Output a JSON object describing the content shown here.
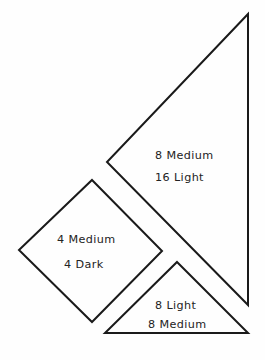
{
  "canvas": {
    "width": 265,
    "height": 360,
    "background_color": "#fefefe",
    "line_color": "#1a1a1a",
    "text_color": "#232323"
  },
  "shapes": [
    {
      "name": "large-right-triangle",
      "type": "triangle",
      "points": "248,14 107,162 248,305",
      "labels": [
        {
          "text": "8  Medium",
          "x": 155,
          "y": 159,
          "anchor": "start"
        },
        {
          "text": "16  Light",
          "x": 155,
          "y": 181,
          "anchor": "start"
        }
      ]
    },
    {
      "name": "square-on-point-diamond",
      "type": "diamond",
      "points": "92,180 162,251 92,322 19,250",
      "labels": [
        {
          "text": "4  Medium",
          "x": 57,
          "y": 243,
          "anchor": "start"
        },
        {
          "text": "4  Dark",
          "x": 64,
          "y": 268,
          "anchor": "start"
        }
      ]
    },
    {
      "name": "small-right-triangle",
      "type": "triangle",
      "points": "177,262 248,333 105,333",
      "labels": [
        {
          "text": "8  Light",
          "x": 155,
          "y": 309,
          "anchor": "start"
        },
        {
          "text": "8  Medium",
          "x": 148,
          "y": 328,
          "anchor": "start"
        }
      ]
    }
  ],
  "legend": {
    "fabric_values": [
      "Light",
      "Medium",
      "Dark"
    ],
    "quantities": [
      {
        "piece": "large-right-triangle",
        "count": 8,
        "fabric": "Medium"
      },
      {
        "piece": "large-right-triangle",
        "count": 16,
        "fabric": "Light"
      },
      {
        "piece": "square-on-point-diamond",
        "count": 4,
        "fabric": "Medium"
      },
      {
        "piece": "square-on-point-diamond",
        "count": 4,
        "fabric": "Dark"
      },
      {
        "piece": "small-right-triangle",
        "count": 8,
        "fabric": "Light"
      },
      {
        "piece": "small-right-triangle",
        "count": 8,
        "fabric": "Medium"
      }
    ]
  }
}
